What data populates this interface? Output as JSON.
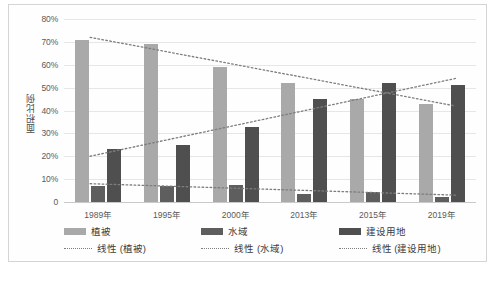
{
  "chart_data": {
    "type": "bar",
    "title": "",
    "xlabel": "",
    "ylabel": "面积比例",
    "ylim": [
      0,
      80
    ],
    "grid": true,
    "legend_position": "bottom",
    "categories": [
      "1989年",
      "1995年",
      "2000年",
      "2013年",
      "2015年",
      "2019年"
    ],
    "ytick_labels": [
      "0",
      "10%",
      "20%",
      "30%",
      "40%",
      "50%",
      "60%",
      "70%",
      "80%"
    ],
    "ytick_values": [
      0,
      10,
      20,
      30,
      40,
      50,
      60,
      70,
      80
    ],
    "series": [
      {
        "name": "植被",
        "key": "veg",
        "color": "#a9a9a9",
        "values": [
          71,
          69,
          59,
          52,
          45,
          43
        ]
      },
      {
        "name": "水域",
        "key": "water",
        "color": "#5e5e5e",
        "values": [
          7,
          7,
          7.5,
          3.5,
          4.5,
          2
        ]
      },
      {
        "name": "建设用地",
        "key": "constr",
        "color": "#4f4f4f",
        "values": [
          23,
          25,
          33,
          45,
          52,
          51
        ]
      }
    ],
    "trendlines": [
      {
        "name": "线性 (植被)",
        "key": "veg",
        "color": "#7d7d7d",
        "start": 72,
        "end": 42
      },
      {
        "name": "线性 (水域)",
        "key": "water",
        "color": "#7d7d7d",
        "start": 8,
        "end": 3
      },
      {
        "name": "线性 (建设用地)",
        "key": "constr",
        "color": "#7d7d7d",
        "start": 20,
        "end": 54
      }
    ]
  },
  "legend": {
    "row1": [
      "植被",
      "水域",
      "建设用地"
    ],
    "row2": [
      "线性 (植被)",
      "线性 (水域)",
      "线性 (建设用地)"
    ]
  },
  "caption": ""
}
